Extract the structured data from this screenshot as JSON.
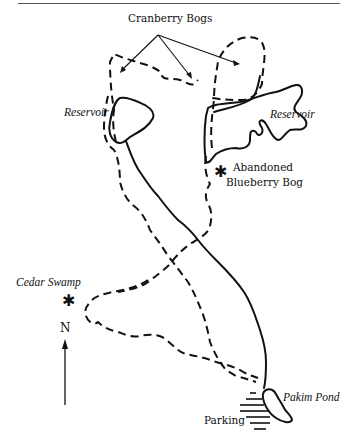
{
  "map": {
    "title_rule": true,
    "labels": {
      "cranberry_bogs": "Cranberry Bogs",
      "reservoir_west": "Reservoir",
      "reservoir_east": "Reservoir",
      "abandoned_bog_line1": "Abandoned",
      "abandoned_bog_line2": "Blueberry Bog",
      "cedar_swamp": "Cedar Swamp",
      "north": "N",
      "pakim_pond": "Pakim Pond",
      "parking": "Parking"
    },
    "symbols": {
      "landmark_marker": "asterisk",
      "north_arrow": "arrow-up",
      "parking_area": "hatched-lines"
    },
    "legend_styles": {
      "trail": "dashed line",
      "road_or_shore": "solid line"
    },
    "colors": {
      "ink": "#111111",
      "background": "#ffffff"
    }
  }
}
